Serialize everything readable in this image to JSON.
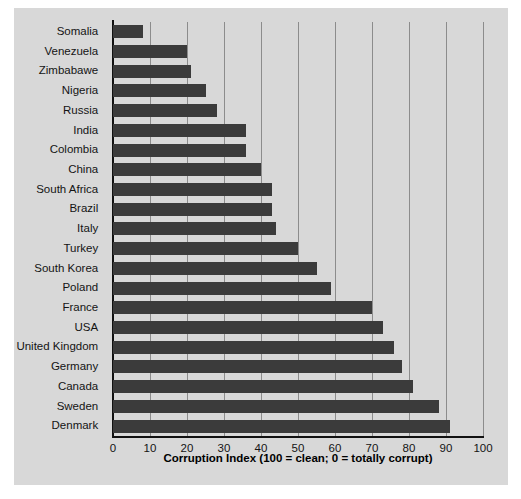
{
  "chart_data": {
    "type": "bar",
    "orientation": "horizontal",
    "title": "",
    "xlabel": "Corruption Index (100 = clean; 0 = totally corrupt)",
    "ylabel": "",
    "xlim": [
      0,
      100
    ],
    "xticks": [
      0,
      10,
      20,
      30,
      40,
      50,
      60,
      70,
      80,
      90,
      100
    ],
    "grid": "vertical",
    "legend": "none",
    "bar_color": "#3b3b3b",
    "plot_background": "#d8d8d8",
    "gridline_color": "#8c8c8c",
    "categories": [
      "Somalia",
      "Venezuela",
      "Zimbabawe",
      "Nigeria",
      "Russia",
      "India",
      "Colombia",
      "China",
      "South Africa",
      "Brazil",
      "Italy",
      "Turkey",
      "South Korea",
      "Poland",
      "France",
      "USA",
      "United Kingdom",
      "Germany",
      "Canada",
      "Sweden",
      "Denmark"
    ],
    "values": [
      8,
      20,
      21,
      25,
      28,
      36,
      36,
      40,
      43,
      43,
      44,
      50,
      55,
      59,
      70,
      73,
      76,
      78,
      81,
      88,
      91
    ]
  }
}
